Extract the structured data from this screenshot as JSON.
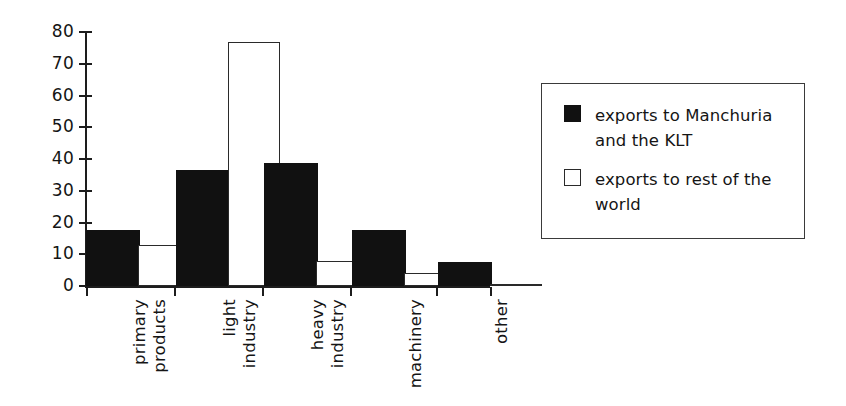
{
  "chart_data": {
    "type": "bar",
    "title": "",
    "subtitle": "",
    "xlabel": "",
    "ylabel": "",
    "ylim": [
      0,
      80
    ],
    "yticks": [
      0,
      10,
      20,
      30,
      40,
      50,
      60,
      70,
      80
    ],
    "ytick_labels": [
      "0",
      "10",
      "20",
      "30",
      "40",
      "50",
      "60",
      "70",
      "80"
    ],
    "grid": false,
    "legend_position": "right",
    "categories": [
      "primary products",
      "light industry",
      "heavy industry",
      "machinery",
      "other"
    ],
    "category_label_lines": [
      [
        "primary",
        "products"
      ],
      [
        "light",
        "industry"
      ],
      [
        "heavy",
        "industry"
      ],
      [
        "machinery"
      ],
      [
        "other"
      ]
    ],
    "series": [
      {
        "name": "exports to Manchuria and the KLT",
        "color": "#111111",
        "style": "filled",
        "values": [
          17,
          36,
          38,
          17,
          7
        ]
      },
      {
        "name": "exports to rest of the world",
        "color": "#ffffff",
        "style": "outlined",
        "values": [
          13,
          77,
          8,
          4,
          0.5
        ]
      }
    ]
  },
  "legend": {
    "items": [
      {
        "label": "exports to Manchuria and the KLT",
        "swatch": "filled-black-square"
      },
      {
        "label": "exports to rest of the world",
        "swatch": "outlined-white-square"
      }
    ]
  },
  "colors": {
    "bar_dark": "#111111",
    "bar_light": "#ffffff",
    "axis": "#1d1d1d",
    "text": "#151515",
    "background": "#ffffff"
  }
}
